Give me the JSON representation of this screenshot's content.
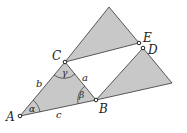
{
  "diagram": {
    "fill_color": "#c8c8c8",
    "stroke_color": "#333333",
    "points": {
      "A": {
        "label": "A"
      },
      "B": {
        "label": "B"
      },
      "C": {
        "label": "C"
      },
      "D": {
        "label": "D"
      },
      "E": {
        "label": "E"
      }
    },
    "sides": {
      "a": "a",
      "b": "b",
      "c": "c"
    },
    "angles": {
      "alpha": "α",
      "beta": "β",
      "gamma": "γ"
    }
  }
}
